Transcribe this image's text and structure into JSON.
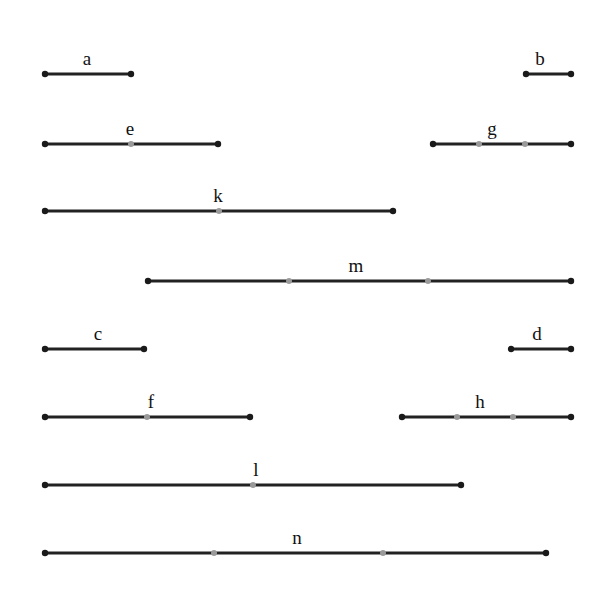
{
  "diagram": {
    "title": "",
    "colors": {
      "line": "#222222",
      "endpoint": "#1a1a1a",
      "division_point": "#9a9a9a",
      "label": "#111111",
      "background": "#ffffff"
    },
    "segments": [
      {
        "label": "a",
        "y": 74,
        "x1": 45,
        "x2": 131,
        "divisions": [],
        "label_x": 87
      },
      {
        "label": "b",
        "y": 74,
        "x1": 526,
        "x2": 571,
        "divisions": [],
        "label_x": 540
      },
      {
        "label": "e",
        "y": 144,
        "x1": 45,
        "x2": 218,
        "divisions": [
          131
        ],
        "label_x": 130
      },
      {
        "label": "g",
        "y": 144,
        "x1": 433,
        "x2": 571,
        "divisions": [
          479,
          525
        ],
        "label_x": 492
      },
      {
        "label": "k",
        "y": 211,
        "x1": 45,
        "x2": 393,
        "divisions": [
          219
        ],
        "label_x": 218
      },
      {
        "label": "m",
        "y": 281,
        "x1": 148,
        "x2": 571,
        "divisions": [
          289,
          428
        ],
        "label_x": 356
      },
      {
        "label": "c",
        "y": 349,
        "x1": 45,
        "x2": 144,
        "divisions": [],
        "label_x": 98
      },
      {
        "label": "d",
        "y": 349,
        "x1": 511,
        "x2": 571,
        "divisions": [],
        "label_x": 537
      },
      {
        "label": "f",
        "y": 417,
        "x1": 45,
        "x2": 250,
        "divisions": [
          147
        ],
        "label_x": 151
      },
      {
        "label": "h",
        "y": 417,
        "x1": 402,
        "x2": 571,
        "divisions": [
          457,
          513
        ],
        "label_x": 480
      },
      {
        "label": "l",
        "y": 485,
        "x1": 45,
        "x2": 461,
        "divisions": [
          253
        ],
        "label_x": 256
      },
      {
        "label": "n",
        "y": 553,
        "x1": 45,
        "x2": 546,
        "divisions": [
          214,
          383
        ],
        "label_x": 297
      }
    ]
  }
}
